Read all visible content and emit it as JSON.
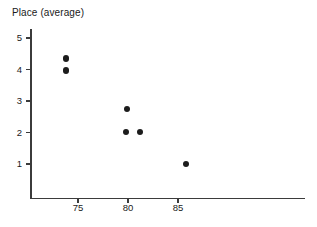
{
  "chart_data": {
    "type": "scatter",
    "title": "",
    "ylabel": "Place (average)",
    "xlabel": "",
    "xticks": [
      75,
      80,
      85
    ],
    "yticks": [
      1,
      2,
      3,
      4,
      5
    ],
    "xlim": [
      70.8,
      98.5
    ],
    "ylim": [
      0.1,
      5.35
    ],
    "grid": false,
    "legend": null,
    "marker": "filled-circle",
    "marker_color": "#1c1c1c",
    "points": [
      {
        "x": 73.8,
        "y": 4.35
      },
      {
        "x": 73.8,
        "y": 3.97
      },
      {
        "x": 79.9,
        "y": 2.75
      },
      {
        "x": 79.8,
        "y": 2.02
      },
      {
        "x": 81.2,
        "y": 2.02
      },
      {
        "x": 85.8,
        "y": 1.0
      }
    ]
  },
  "axis": {
    "y_title": "Place (average)",
    "y_tick_labels": [
      "5",
      "4",
      "3",
      "2",
      "1"
    ],
    "x_tick_labels": [
      "75",
      "80",
      "85"
    ]
  },
  "colors": {
    "axis": "#3b3b3b",
    "marker": "#1c1c1c",
    "text": "#1a1a1a",
    "background": "#ffffff"
  }
}
